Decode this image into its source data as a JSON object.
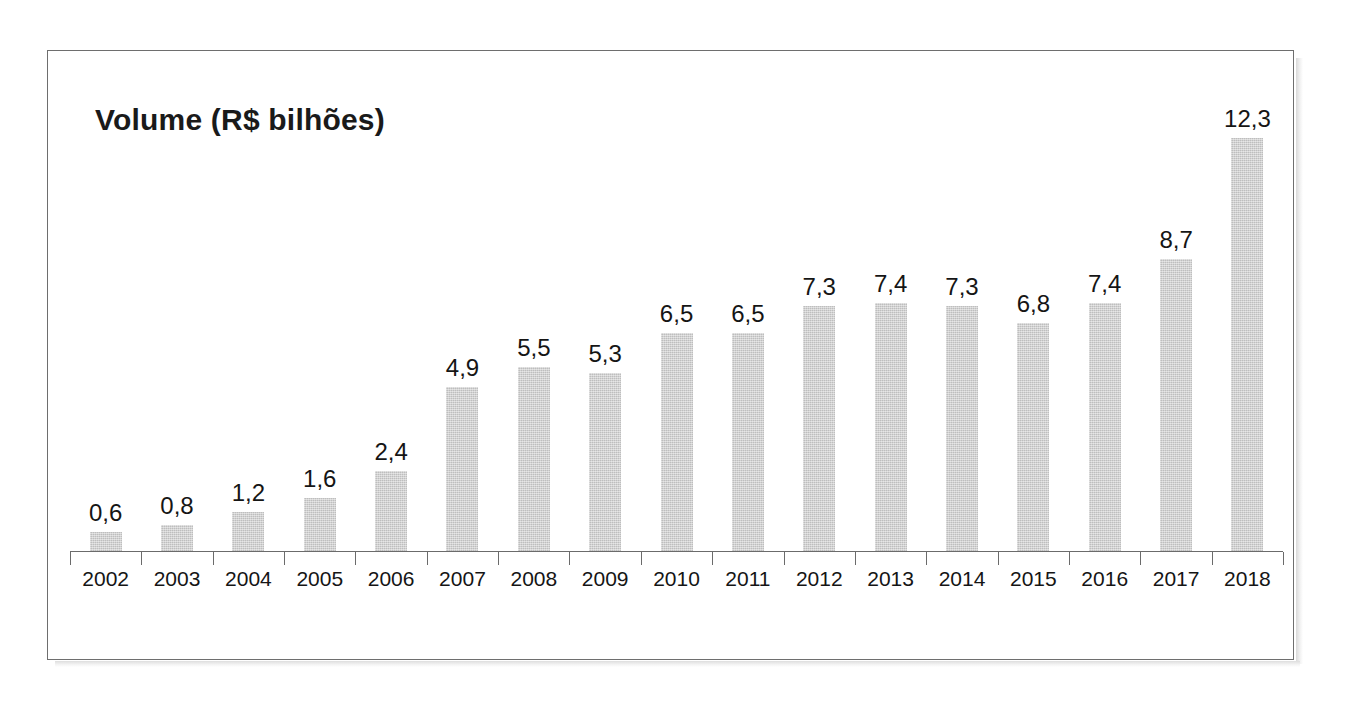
{
  "chart_data": {
    "type": "bar",
    "title": "Volume (R$ bilhões)",
    "xlabel": "",
    "ylabel": "",
    "categories": [
      "2002",
      "2003",
      "2004",
      "2005",
      "2006",
      "2007",
      "2008",
      "2009",
      "2010",
      "2011",
      "2012",
      "2013",
      "2014",
      "2015",
      "2016",
      "2017",
      "2018"
    ],
    "values": [
      0.6,
      0.8,
      1.2,
      1.6,
      2.4,
      4.9,
      5.5,
      5.3,
      6.5,
      6.5,
      7.3,
      7.4,
      7.3,
      6.8,
      7.4,
      8.7,
      12.3
    ],
    "value_labels": [
      "0,6",
      "0,8",
      "1,2",
      "1,6",
      "2,4",
      "4,9",
      "5,5",
      "5,3",
      "6,5",
      "6,5",
      "7,3",
      "7,4",
      "7,3",
      "6,8",
      "7,4",
      "8,7",
      "12,3"
    ],
    "ylim": [
      0,
      14.6
    ],
    "grid": false,
    "legend": null,
    "decimal_separator": ",",
    "series_name": "Volume (R$ bilhões)",
    "bar_color": "#cbcbcb",
    "axis_color": "#6b6b6b",
    "label_color": "#151515",
    "frame_color": "#6e6e6e",
    "background_color": "#ffffff"
  }
}
